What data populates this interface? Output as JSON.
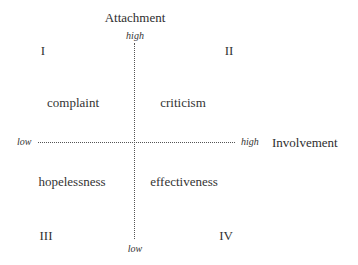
{
  "diagram": {
    "type": "quadrant",
    "axes": {
      "vertical": {
        "title": "Attachment",
        "high_label": "high",
        "low_label": "low"
      },
      "horizontal": {
        "title": "Involvement",
        "high_label": "high",
        "low_label": "low"
      }
    },
    "quadrants": [
      {
        "numeral": "I",
        "label": "complaint"
      },
      {
        "numeral": "II",
        "label": "criticism"
      },
      {
        "numeral": "III",
        "label": "hopelessness"
      },
      {
        "numeral": "IV",
        "label": "effectiveness"
      }
    ],
    "colors": {
      "text": "#333333",
      "axis_line": "#555555",
      "background": "#ffffff"
    }
  }
}
